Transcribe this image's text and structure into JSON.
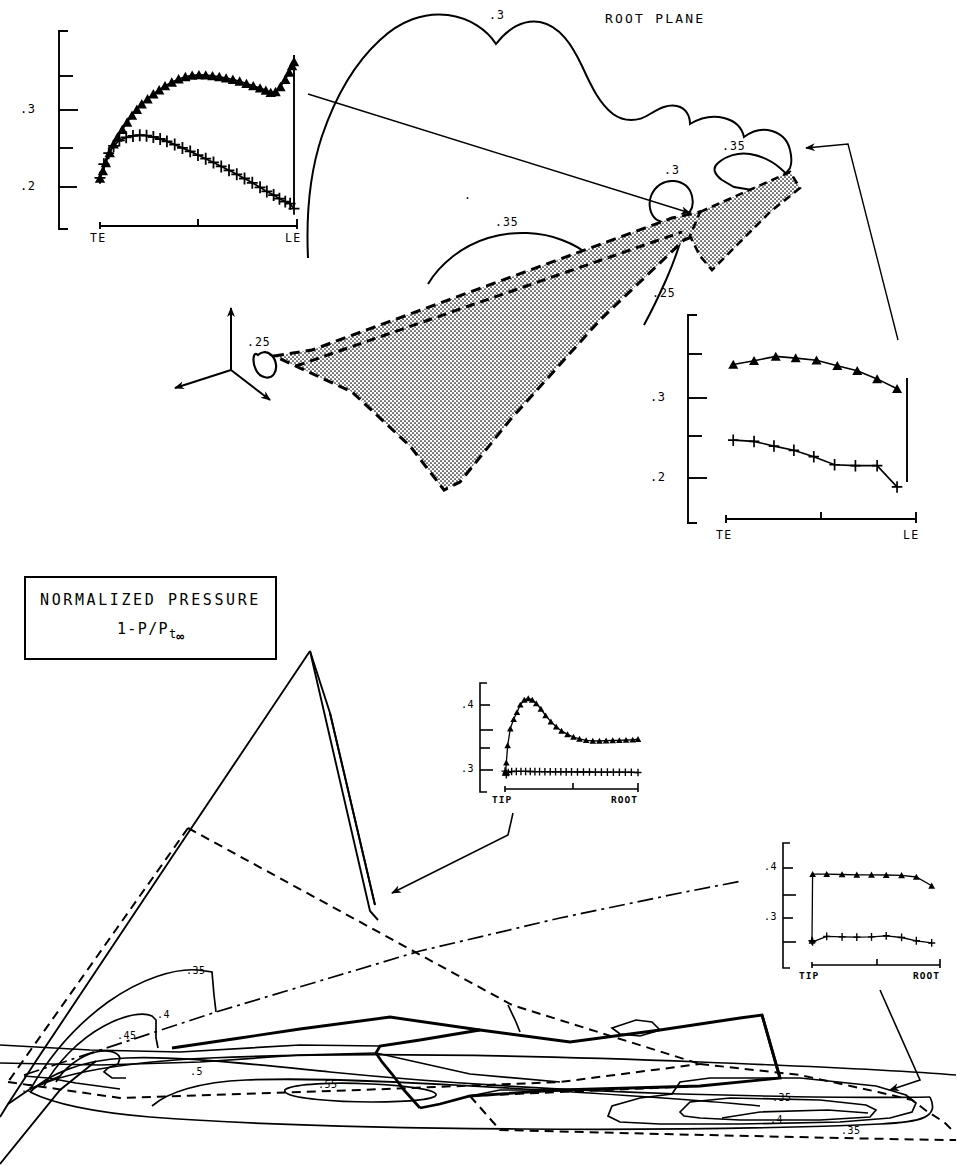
{
  "figure": {
    "title_root_plane": "ROOT PLANE",
    "legend": {
      "line1": "NORMALIZED PRESSURE",
      "line2_main": "1-P/P",
      "line2_sub": "t",
      "line2_inf": "∞"
    }
  },
  "contour_labels_upper": [
    {
      "text": ".3",
      "x": 489,
      "y": 10
    },
    {
      "text": ".35",
      "x": 722,
      "y": 141
    },
    {
      "text": ".3",
      "x": 664,
      "y": 165
    },
    {
      "text": ".35",
      "x": 495,
      "y": 217
    },
    {
      "text": ".25",
      "x": 652,
      "y": 288
    },
    {
      "text": ".25",
      "x": 247,
      "y": 337
    },
    {
      "text": ".",
      "x": 464,
      "y": 190
    }
  ],
  "contour_labels_lower": [
    {
      "text": ".35",
      "x": 186,
      "y": 966
    },
    {
      "text": ".4",
      "x": 157,
      "y": 1010
    },
    {
      "text": ".45",
      "x": 117,
      "y": 1031
    },
    {
      "text": ".5",
      "x": 190,
      "y": 1067
    },
    {
      "text": ".55",
      "x": 318,
      "y": 1080
    },
    {
      "text": ".3",
      "x": 21,
      "y": 1084
    },
    {
      "text": ".35",
      "x": 772,
      "y": 1093
    },
    {
      "text": ".4",
      "x": 770,
      "y": 1115
    },
    {
      "text": ".35",
      "x": 841,
      "y": 1126
    }
  ],
  "chart_data": [
    {
      "id": "chart-root-plane-upper-left",
      "type": "line",
      "title": "",
      "xlabel": "",
      "ylabel": "",
      "x_tick_labels": [
        "TE",
        "LE"
      ],
      "xlim": [
        0,
        1
      ],
      "ylim": [
        0.175,
        0.375
      ],
      "y_tick_values": [
        0.2,
        0.25,
        0.3,
        0.35
      ],
      "y_tick_labels": [
        "",
        ".2",
        "",
        ".3",
        ""
      ],
      "y_labeled": [
        {
          "value": 0.3,
          "label": ".3"
        },
        {
          "value": 0.2,
          "label": ".2"
        }
      ],
      "grid": false,
      "legend": "none",
      "series": [
        {
          "name": "upper-surface",
          "marker": "triangle",
          "x": [
            0.0,
            0.015,
            0.03,
            0.05,
            0.07,
            0.09,
            0.115,
            0.14,
            0.165,
            0.19,
            0.215,
            0.245,
            0.275,
            0.305,
            0.335,
            0.37,
            0.405,
            0.44,
            0.475,
            0.51,
            0.545,
            0.58,
            0.615,
            0.65,
            0.685,
            0.72,
            0.755,
            0.79,
            0.825,
            0.855,
            0.88,
            0.905,
            0.93,
            0.955,
            0.975,
            0.99,
            1.0
          ],
          "y": [
            0.2275,
            0.2355,
            0.2445,
            0.2555,
            0.265,
            0.2725,
            0.281,
            0.289,
            0.2965,
            0.303,
            0.309,
            0.3145,
            0.32,
            0.3245,
            0.329,
            0.333,
            0.3365,
            0.339,
            0.3405,
            0.341,
            0.3408,
            0.34,
            0.339,
            0.3375,
            0.336,
            0.334,
            0.3315,
            0.329,
            0.3265,
            0.324,
            0.3215,
            0.3225,
            0.328,
            0.336,
            0.344,
            0.351,
            0.3555
          ]
        },
        {
          "name": "lower-surface",
          "marker": "plus",
          "x": [
            0.0,
            0.02,
            0.045,
            0.07,
            0.1,
            0.135,
            0.17,
            0.205,
            0.24,
            0.275,
            0.31,
            0.345,
            0.385,
            0.425,
            0.465,
            0.505,
            0.545,
            0.585,
            0.625,
            0.665,
            0.705,
            0.745,
            0.785,
            0.825,
            0.86,
            0.895,
            0.925,
            0.955,
            0.98,
            1.0
          ],
          "y": [
            0.228,
            0.243,
            0.255,
            0.263,
            0.269,
            0.2725,
            0.274,
            0.2748,
            0.2742,
            0.2728,
            0.2706,
            0.268,
            0.2645,
            0.2608,
            0.257,
            0.253,
            0.249,
            0.2448,
            0.2405,
            0.2362,
            0.2318,
            0.2272,
            0.2225,
            0.2175,
            0.213,
            0.209,
            0.205,
            0.2018,
            0.1995,
            0.194
          ]
        }
      ],
      "vertical_le_bar": true
    },
    {
      "id": "chart-root-plane-right",
      "type": "line",
      "x_tick_labels": [
        "TE",
        "LE"
      ],
      "xlim": [
        0,
        1
      ],
      "ylim": [
        0.175,
        0.375
      ],
      "y_tick_values": [
        0.2,
        0.25,
        0.3,
        0.35
      ],
      "y_labeled": [
        {
          "value": 0.3,
          "label": ".3"
        },
        {
          "value": 0.2,
          "label": ".2"
        }
      ],
      "grid": false,
      "legend": "none",
      "series": [
        {
          "name": "upper-surface",
          "marker": "triangle",
          "x": [
            0.04,
            0.155,
            0.275,
            0.385,
            0.5,
            0.615,
            0.725,
            0.835,
            0.945
          ],
          "y": [
            0.3415,
            0.346,
            0.351,
            0.349,
            0.3465,
            0.34,
            0.334,
            0.3245,
            0.313
          ]
        },
        {
          "name": "lower-surface",
          "marker": "plus",
          "x": [
            0.04,
            0.155,
            0.265,
            0.375,
            0.485,
            0.6,
            0.715,
            0.835,
            0.945
          ],
          "y": [
            0.2525,
            0.251,
            0.2455,
            0.2405,
            0.233,
            0.2235,
            0.2225,
            0.2225,
            0.1975
          ]
        }
      ],
      "vertical_le_bar": true
    },
    {
      "id": "chart-tip-root-middle",
      "type": "line",
      "x_tick_labels": [
        "TIP",
        "ROOT"
      ],
      "xlim": [
        0,
        1
      ],
      "ylim": [
        0.255,
        0.465
      ],
      "y_tick_values": [
        0.3,
        0.35,
        0.4,
        0.45
      ],
      "y_labeled": [
        {
          "value": 0.4,
          "label": ".4"
        },
        {
          "value": 0.3,
          "label": ".3"
        }
      ],
      "grid": false,
      "legend": "none",
      "series": [
        {
          "name": "upper-surface",
          "marker": "triangle",
          "x": [
            0.0,
            0.005,
            0.01,
            0.02,
            0.04,
            0.065,
            0.09,
            0.115,
            0.145,
            0.175,
            0.205,
            0.235,
            0.27,
            0.305,
            0.345,
            0.385,
            0.425,
            0.47,
            0.515,
            0.56,
            0.61,
            0.66,
            0.71,
            0.76,
            0.81,
            0.86,
            0.91,
            0.96,
            1.0
          ],
          "y": [
            0.283,
            0.287,
            0.305,
            0.342,
            0.378,
            0.398,
            0.413,
            0.429,
            0.4395,
            0.4425,
            0.4395,
            0.432,
            0.42,
            0.406,
            0.393,
            0.382,
            0.373,
            0.3655,
            0.36,
            0.356,
            0.353,
            0.3518,
            0.3515,
            0.352,
            0.3525,
            0.353,
            0.3535,
            0.354,
            0.3555
          ]
        },
        {
          "name": "lower-surface",
          "marker": "plus",
          "x": [
            0.0,
            0.01,
            0.025,
            0.05,
            0.085,
            0.12,
            0.155,
            0.19,
            0.225,
            0.26,
            0.3,
            0.34,
            0.38,
            0.42,
            0.46,
            0.5,
            0.545,
            0.59,
            0.635,
            0.68,
            0.725,
            0.77,
            0.815,
            0.86,
            0.905,
            0.95,
            1.0
          ],
          "y": [
            0.287,
            0.279,
            0.284,
            0.286,
            0.2862,
            0.2862,
            0.2862,
            0.286,
            0.2858,
            0.2858,
            0.2856,
            0.2856,
            0.2854,
            0.2854,
            0.2852,
            0.2852,
            0.285,
            0.285,
            0.285,
            0.2848,
            0.2848,
            0.2848,
            0.2846,
            0.2846,
            0.2846,
            0.2844,
            0.284
          ]
        }
      ]
    },
    {
      "id": "chart-tip-root-lower-right",
      "type": "line",
      "x_tick_labels": [
        "TIP",
        "ROOT"
      ],
      "xlim": [
        0,
        1
      ],
      "ylim": [
        0.245,
        0.445
      ],
      "y_tick_values": [
        0.28,
        0.32,
        0.36,
        0.4
      ],
      "y_labeled": [
        {
          "value": 0.4,
          "label": ".4"
        },
        {
          "value": 0.32,
          "label": ".3"
        }
      ],
      "grid": false,
      "legend": "none",
      "series": [
        {
          "name": "upper-surface",
          "marker": "triangle",
          "x": [
            0.0,
            0.005,
            0.115,
            0.235,
            0.35,
            0.465,
            0.58,
            0.7,
            0.815,
            0.935
          ],
          "y": [
            0.28,
            0.401,
            0.401,
            0.4005,
            0.4,
            0.4,
            0.3995,
            0.399,
            0.396,
            0.38
          ]
        },
        {
          "name": "lower-surface",
          "marker": "plus",
          "x": [
            0.0,
            0.005,
            0.115,
            0.235,
            0.35,
            0.465,
            0.58,
            0.7,
            0.815,
            0.935
          ],
          "y": [
            0.28,
            0.278,
            0.288,
            0.287,
            0.2865,
            0.287,
            0.289,
            0.286,
            0.28,
            0.276
          ]
        }
      ]
    }
  ]
}
